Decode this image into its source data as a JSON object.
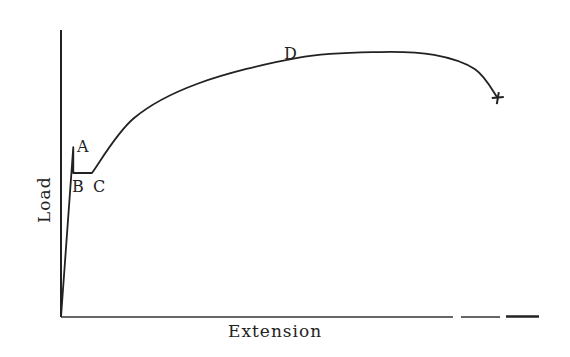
{
  "chart_data": {
    "type": "line",
    "title": "",
    "xlabel": "Extension",
    "ylabel": "Load",
    "grid": false,
    "legend": "none",
    "x_axis_dashed_end": true,
    "curve": {
      "name": "load-extension curve",
      "description": "Typical stress-strain (load-extension) curve for mild steel",
      "x": [
        0,
        0.027,
        0.027,
        0.068,
        0.16,
        0.3,
        0.52,
        0.7,
        0.82,
        0.91,
        0.96
      ],
      "y": [
        0,
        0.59,
        0.5,
        0.5,
        0.69,
        0.81,
        0.9,
        0.92,
        0.91,
        0.86,
        0.76
      ],
      "end_marker": "cross"
    },
    "annotations": [
      {
        "text": "A",
        "meaning": "upper yield point"
      },
      {
        "text": "B",
        "meaning": "lower yield point"
      },
      {
        "text": "C",
        "meaning": "end of yield plateau"
      },
      {
        "text": "D",
        "meaning": "maximum load"
      }
    ]
  }
}
